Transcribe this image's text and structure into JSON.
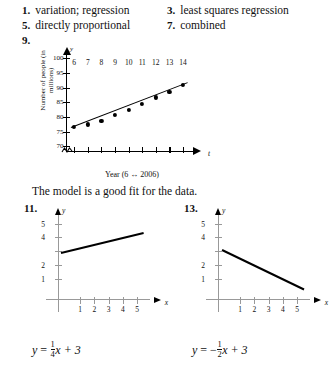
{
  "answers": [
    {
      "num": "1.",
      "text": "variation; regression"
    },
    {
      "num": "3.",
      "text": "least squares regression"
    },
    {
      "num": "5.",
      "text": "directly proportional"
    },
    {
      "num": "7.",
      "text": "combined"
    },
    {
      "num": "9.",
      "text": ""
    }
  ],
  "fit_note": "The model is a good fit for the data.",
  "chart_data": [
    {
      "type": "scatter",
      "id": "exercise-9-scatter",
      "title": "",
      "xlabel": "Year (6 ↔ 2006)",
      "ylabel": "Number of people (in millions)",
      "x_symbol": "t",
      "y_symbol": "y",
      "xticks": [
        6,
        7,
        8,
        9,
        10,
        11,
        12,
        13,
        14
      ],
      "yticks": [
        70,
        75,
        80,
        85,
        90,
        95,
        100
      ],
      "xlim": [
        5.4,
        14.8
      ],
      "ylim": [
        68,
        101.5
      ],
      "axis_break": true,
      "grid": false,
      "legend": "none",
      "x": [
        6,
        7,
        8,
        9,
        10,
        11,
        12,
        13,
        14
      ],
      "values": [
        77.1,
        78.1,
        79.3,
        81.2,
        83.1,
        85.0,
        87.3,
        89.3,
        91.5
      ],
      "trendline": {
        "x0": 5.8,
        "y0": 76.6,
        "x1": 14.4,
        "y1": 92.0
      }
    },
    {
      "type": "line",
      "id": "exercise-11-line",
      "num": "11.",
      "equation_lhs": "y",
      "equation_eq": "=",
      "equation_num": "1",
      "equation_den": "4",
      "equation_tail": "x + 3",
      "equation_sign": "",
      "x_symbol": "x",
      "y_symbol": "y",
      "xticks": [
        1,
        2,
        3,
        4,
        5
      ],
      "yticks": [
        1,
        2,
        3,
        4,
        5
      ],
      "xlim": [
        -0.55,
        5.9
      ],
      "ylim": [
        -0.55,
        5.7
      ],
      "grid": false,
      "legend": "none",
      "slope": 0.25,
      "intercept": 3,
      "segment": {
        "x0": -0.35,
        "y0": 2.91,
        "x1": 5.45,
        "y1": 4.36
      }
    },
    {
      "type": "line",
      "id": "exercise-13-line",
      "num": "13.",
      "equation_lhs": "y",
      "equation_eq": "=",
      "equation_num": "1",
      "equation_den": "2",
      "equation_tail": "x + 3",
      "equation_sign": "−",
      "x_symbol": "x",
      "y_symbol": "y",
      "xticks": [
        1,
        2,
        3,
        4,
        5
      ],
      "yticks": [
        1,
        2,
        3,
        4,
        5
      ],
      "xlim": [
        -0.55,
        5.9
      ],
      "ylim": [
        -0.55,
        5.7
      ],
      "grid": false,
      "legend": "none",
      "slope": -0.5,
      "intercept": 3,
      "segment": {
        "x0": -0.3,
        "y0": 3.15,
        "x1": 5.45,
        "y1": 0.28
      }
    }
  ]
}
